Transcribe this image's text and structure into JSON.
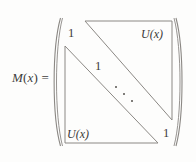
{
  "figure": {
    "kind": "matrix-equation",
    "lhs": {
      "symbol": "M",
      "open_paren": "(",
      "variable": "x",
      "close_paren": ")",
      "equals": "="
    },
    "bracket": {
      "style": "parenthesis",
      "left": "(",
      "right": ")"
    },
    "entries": [
      {
        "id": "top-left-one",
        "text": "1",
        "role": "diagonal-entry"
      },
      {
        "id": "top-right-block",
        "text": "U(x)",
        "role": "upper-triangular-block"
      },
      {
        "id": "middle-one",
        "text": "1",
        "role": "diagonal-entry"
      },
      {
        "id": "bottom-left-block",
        "text": "U(x)",
        "role": "lower-triangular-block"
      },
      {
        "id": "bottom-right-one",
        "text": "1",
        "role": "diagonal-entry"
      }
    ],
    "ellipsis": {
      "glyph": "ddots",
      "dot_count": 3,
      "direction": "down-right"
    },
    "colors": {
      "background": "#fdfdfc",
      "line": "#8b8884",
      "text": "#3b3938",
      "label": "#403e3d",
      "dot": "#56534f"
    }
  }
}
